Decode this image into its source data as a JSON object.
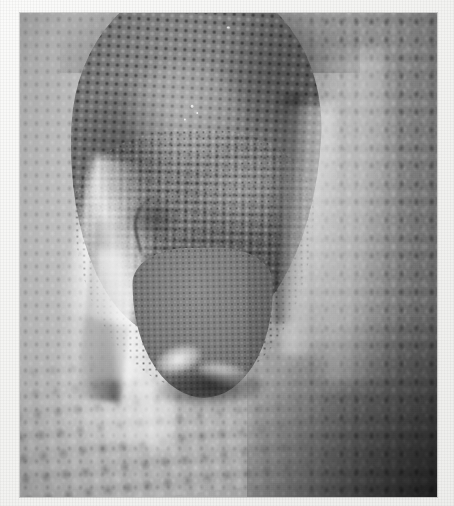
{
  "image": {
    "kind": "photograph",
    "subject": "snake-head",
    "description": "Black and white close-up photograph of a snake's head resting on its own coiled body",
    "color_mode": "grayscale",
    "orientation": "portrait",
    "canvas": {
      "width": 454,
      "height": 506
    },
    "photo_area": {
      "left": 20,
      "top": 13,
      "width": 417,
      "height": 484
    },
    "border": {
      "name": "paper-mat",
      "style": "textured off-white paper margin",
      "color": "#f4f4f2",
      "widths": {
        "left": 20,
        "top": 13,
        "right": 17,
        "bottom": 9
      }
    },
    "palette": {
      "paper": "#f4f4f2",
      "background_light": "#c2c2c2",
      "background_mid": "#b2b2b2",
      "background_dark": "#8e8e8e",
      "head_mid": "#7e7e7e",
      "head_dark": "#5a5a5a",
      "scale_spot": "#262626",
      "highlight": "#f8f8f8",
      "shadow": "#141414"
    },
    "regions": [
      {
        "name": "snake-head",
        "label": "Snake head",
        "position": "upper-centre, angled down-left",
        "texture": "coarse mottled granular scales, dark speckles on mid-grey"
      },
      {
        "name": "snout",
        "label": "Snout / rostrum",
        "position": "lower-centre",
        "texture": "finer scales with bright labial highlights and dark shadow under the tip"
      },
      {
        "name": "eye-region",
        "label": "Eye and loreal shadow",
        "position": "left of head, mid-height",
        "texture": "dark curved crease line with soft shadow"
      },
      {
        "name": "coil-left",
        "label": "Coiled body, left",
        "position": "left margin",
        "texture": "smooth pale diamond scales"
      },
      {
        "name": "coil-right",
        "label": "Coiled body, right",
        "position": "right margin",
        "texture": "coarser banded scale rows, darkening to the corner"
      },
      {
        "name": "coil-lower",
        "label": "Coiled body, lower",
        "position": "bottom",
        "texture": "large rounded scales in oblique rows"
      }
    ],
    "effects": {
      "grain": "film grain",
      "vignette": "soft darkening at the corners, strongest bottom-right"
    }
  }
}
